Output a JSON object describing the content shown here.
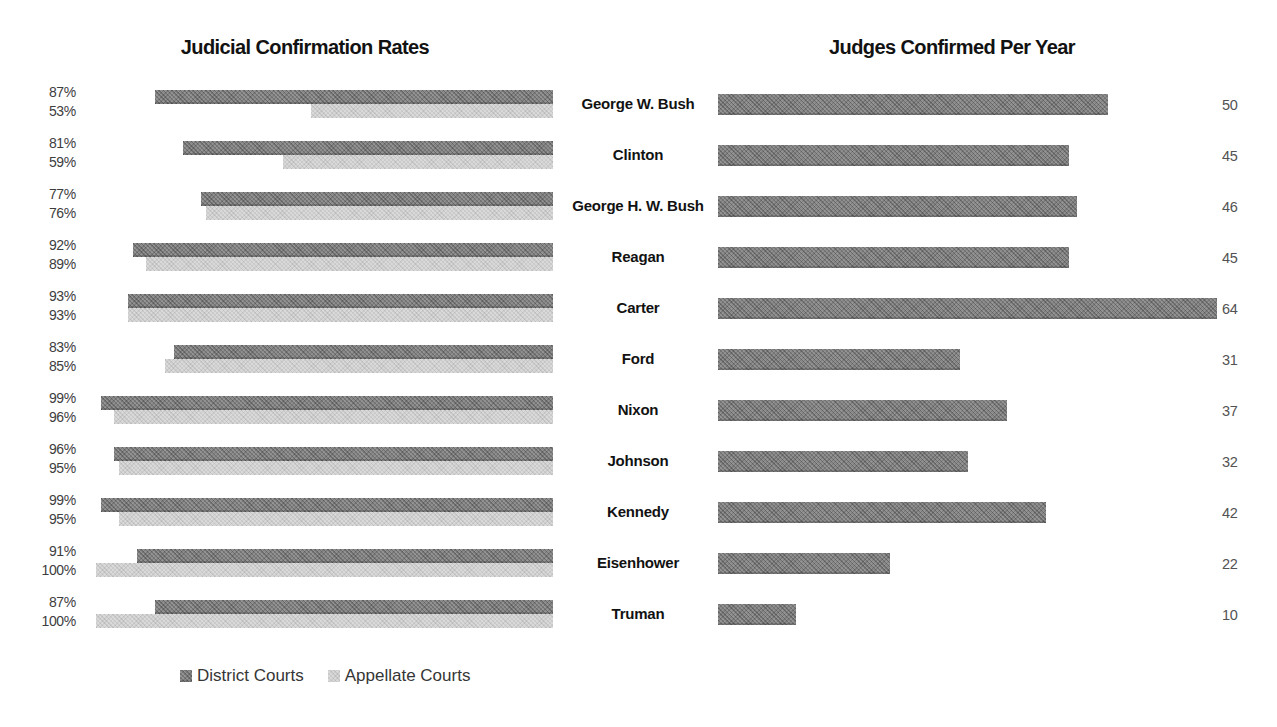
{
  "left_chart": {
    "title": "Judicial Confirmation Rates"
  },
  "right_chart": {
    "title": "Judges Confirmed Per Year"
  },
  "legend": {
    "items": [
      {
        "label": "District Courts",
        "color": "#8b8b8b"
      },
      {
        "label": "Appellate Courts",
        "color": "#d9d9d9"
      }
    ]
  },
  "colors": {
    "district_bar": "#8b8b8b",
    "appellate_bar": "#d9d9d9",
    "title_text": "#121212",
    "president_text": "#121212",
    "rate_label_text": "#3d3d3d",
    "value_label_text": "#525252",
    "background": "#ffffff"
  },
  "chart_data": [
    {
      "type": "bar",
      "orientation": "horizontal",
      "anchor": "right",
      "title": "Judicial Confirmation Rates",
      "categories": [
        "George W. Bush",
        "Clinton",
        "George H. W. Bush",
        "Reagan",
        "Carter",
        "Ford",
        "Nixon",
        "Johnson",
        "Kennedy",
        "Eisenhower",
        "Truman"
      ],
      "series": [
        {
          "name": "District Courts",
          "values": [
            87,
            81,
            77,
            92,
            93,
            83,
            99,
            96,
            99,
            91,
            87
          ],
          "labels": [
            "87%",
            "81%",
            "77%",
            "92%",
            "93%",
            "83%",
            "99%",
            "96%",
            "99%",
            "91%",
            "87%"
          ]
        },
        {
          "name": "Appellate Courts",
          "values": [
            53,
            59,
            76,
            89,
            93,
            85,
            96,
            95,
            95,
            100,
            100
          ],
          "labels": [
            "53%",
            "59%",
            "76%",
            "89%",
            "93%",
            "85%",
            "96%",
            "95%",
            "95%",
            "100%",
            "100%"
          ]
        }
      ],
      "xlim": [
        0,
        100
      ],
      "unit": "percent",
      "grid": false,
      "legend_position": "bottom-left"
    },
    {
      "type": "bar",
      "orientation": "horizontal",
      "anchor": "left",
      "title": "Judges Confirmed Per Year",
      "categories": [
        "George W. Bush",
        "Clinton",
        "George H. W. Bush",
        "Reagan",
        "Carter",
        "Ford",
        "Nixon",
        "Johnson",
        "Kennedy",
        "Eisenhower",
        "Truman"
      ],
      "values": [
        50,
        45,
        46,
        45,
        64,
        31,
        37,
        32,
        42,
        22,
        10
      ],
      "labels": [
        "50",
        "45",
        "46",
        "45",
        "64",
        "31",
        "37",
        "32",
        "42",
        "22",
        "10"
      ],
      "xlim": [
        0,
        64
      ],
      "grid": false,
      "legend_position": "none"
    }
  ]
}
